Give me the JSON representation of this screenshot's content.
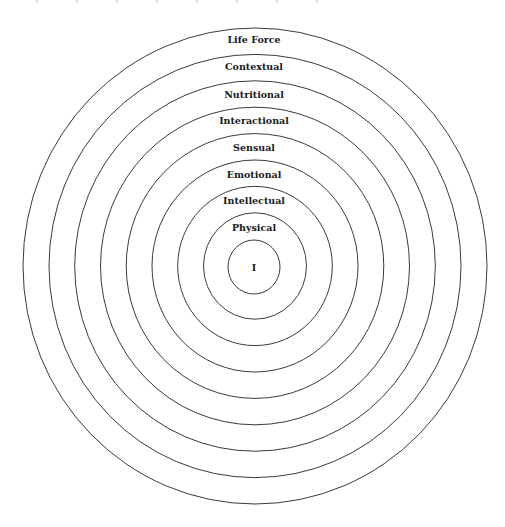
{
  "diagram": {
    "type": "concentric-circles",
    "center": {
      "x": 255,
      "y": 266
    },
    "ring_spacing": {
      "x": 25.75,
      "y": 26.4
    },
    "innermost_radius": {
      "x": 26,
      "y": 27
    },
    "stroke_color": "#3a3a3a",
    "text_color": "#1a1a1a",
    "center_label": "I",
    "rings": [
      {
        "label": "Physical",
        "label_y": 228
      },
      {
        "label": "Intellectual",
        "label_y": 201
      },
      {
        "label": "Emotional",
        "label_y": 175
      },
      {
        "label": "Sensual",
        "label_y": 148
      },
      {
        "label": "Interactional",
        "label_y": 121
      },
      {
        "label": "Nutritional",
        "label_y": 95
      },
      {
        "label": "Contextual",
        "label_y": 67
      },
      {
        "label": "Life Force",
        "label_y": 40
      }
    ]
  }
}
